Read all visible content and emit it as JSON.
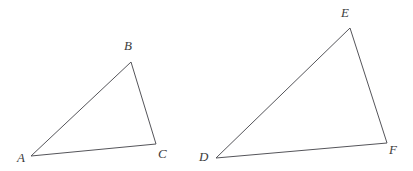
{
  "figure": {
    "name": "two-similar-triangles",
    "background_color": "#ffffff",
    "width": 413,
    "height": 171,
    "stroke_color": "#55555a",
    "stroke_width": 1,
    "label_color": "#3c3c3c"
  },
  "triangles": [
    {
      "id": "abc",
      "name": "triangle-abc",
      "vertices": [
        {
          "label": "A",
          "x": 31,
          "y": 156,
          "label_x": 17,
          "label_y": 151
        },
        {
          "label": "B",
          "x": 131,
          "y": 62,
          "label_x": 124,
          "label_y": 39
        },
        {
          "label": "C",
          "x": 156,
          "y": 144,
          "label_x": 158,
          "label_y": 147
        }
      ],
      "points": "31,156 131,62 156,144"
    },
    {
      "id": "def",
      "name": "triangle-def",
      "vertices": [
        {
          "label": "D",
          "x": 216,
          "y": 158,
          "label_x": 199,
          "label_y": 150
        },
        {
          "label": "E",
          "x": 350,
          "y": 28,
          "label_x": 341,
          "label_y": 6
        },
        {
          "label": "F",
          "x": 387,
          "y": 143,
          "label_x": 389,
          "label_y": 143
        }
      ],
      "points": "216,158 350,28 387,143"
    }
  ]
}
